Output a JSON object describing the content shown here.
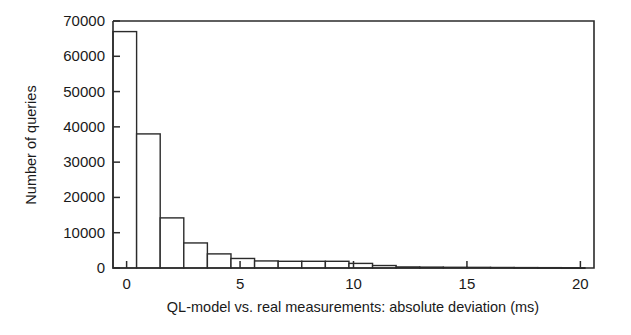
{
  "chart_data": {
    "type": "bar",
    "title": "",
    "subtitle": "",
    "xlabel": "QL-model vs. real measurements: absolute deviation (ms)",
    "ylabel": "Number of queries",
    "xlim": [
      -0.6,
      20.6
    ],
    "ylim": [
      0,
      70000
    ],
    "grid": false,
    "legend": null,
    "x_ticks": [
      0,
      5,
      10,
      15,
      20
    ],
    "x_tick_labels": [
      "0",
      "5",
      "10",
      "15",
      "20"
    ],
    "y_ticks": [
      0,
      10000,
      20000,
      30000,
      40000,
      50000,
      60000,
      70000
    ],
    "y_tick_labels": [
      "0",
      "10000",
      "20000",
      "30000",
      "40000",
      "50000",
      "60000",
      "70000"
    ],
    "bin_width": 1.04,
    "bin_start": -0.6,
    "categories": [
      -0.08,
      0.96,
      2.0,
      3.04,
      4.08,
      5.12,
      6.16,
      7.2,
      8.24,
      9.28,
      10.32,
      11.36,
      12.4,
      13.44,
      14.48,
      15.52,
      16.56,
      17.6,
      18.64,
      19.68
    ],
    "values": [
      67000,
      38000,
      14200,
      7100,
      4000,
      2700,
      2000,
      1900,
      1900,
      1900,
      1300,
      700,
      300,
      250,
      200,
      180,
      150,
      120,
      100,
      80
    ]
  },
  "axis": {
    "y_title": "Number of queries",
    "x_title": "QL-model vs. real measurements: absolute deviation (ms)"
  }
}
